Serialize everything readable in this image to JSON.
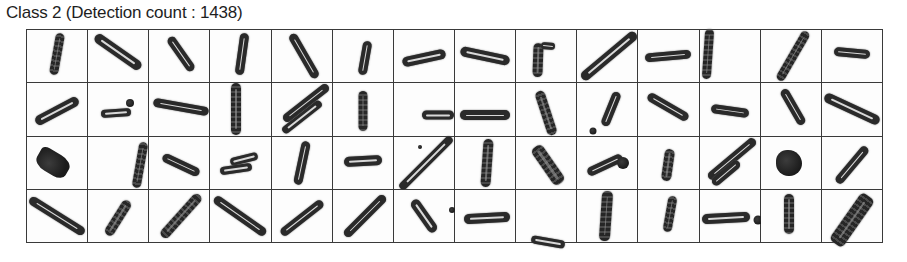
{
  "header": {
    "title": "Class 2 (Detection count : 1438)"
  },
  "grid": {
    "columns": 14,
    "rows": 4,
    "cells": [
      {
        "shapes": [
          {
            "type": "rod",
            "dx": 0,
            "dy": -2,
            "angle": -80,
            "len": 42,
            "w": 9,
            "textured": true
          }
        ]
      },
      {
        "shapes": [
          {
            "type": "rod",
            "dx": 0,
            "dy": -4,
            "angle": 35,
            "len": 55,
            "w": 10
          }
        ]
      },
      {
        "shapes": [
          {
            "type": "rod",
            "dx": 2,
            "dy": -2,
            "angle": 55,
            "len": 40,
            "w": 9
          }
        ]
      },
      {
        "shapes": [
          {
            "type": "rod",
            "dx": 2,
            "dy": -2,
            "angle": -82,
            "len": 42,
            "w": 9
          }
        ]
      },
      {
        "shapes": [
          {
            "type": "rod",
            "dx": 2,
            "dy": 0,
            "angle": 60,
            "len": 50,
            "w": 9
          }
        ]
      },
      {
        "shapes": [
          {
            "type": "rod",
            "dx": 2,
            "dy": 2,
            "angle": -80,
            "len": 34,
            "w": 9
          }
        ]
      },
      {
        "shapes": [
          {
            "type": "rod",
            "dx": 0,
            "dy": 2,
            "angle": -12,
            "len": 44,
            "w": 10
          }
        ]
      },
      {
        "shapes": [
          {
            "type": "rod",
            "dx": 0,
            "dy": 0,
            "angle": 12,
            "len": 50,
            "w": 10
          }
        ]
      },
      {
        "shapes": [
          {
            "type": "rod",
            "dx": -8,
            "dy": 4,
            "angle": -88,
            "len": 34,
            "w": 10,
            "textured": true
          },
          {
            "type": "rod",
            "dx": 2,
            "dy": -10,
            "angle": 5,
            "len": 14,
            "w": 7
          }
        ]
      },
      {
        "shapes": [
          {
            "type": "rod",
            "dx": 2,
            "dy": 0,
            "angle": -40,
            "len": 70,
            "w": 10
          }
        ]
      },
      {
        "shapes": [
          {
            "type": "rod",
            "dx": 0,
            "dy": 0,
            "angle": -5,
            "len": 46,
            "w": 9
          }
        ]
      },
      {
        "shapes": [
          {
            "type": "rod",
            "dx": -22,
            "dy": -2,
            "angle": -86,
            "len": 50,
            "w": 9,
            "textured": true
          }
        ]
      },
      {
        "shapes": [
          {
            "type": "rod",
            "dx": 2,
            "dy": 0,
            "angle": -60,
            "len": 56,
            "w": 9,
            "textured": true
          }
        ]
      },
      {
        "shapes": [
          {
            "type": "rod",
            "dx": 0,
            "dy": -3,
            "angle": 5,
            "len": 36,
            "w": 9
          }
        ]
      },
      {
        "shapes": [
          {
            "type": "rod",
            "dx": 0,
            "dy": 2,
            "angle": -28,
            "len": 48,
            "w": 10
          }
        ]
      },
      {
        "shapes": [
          {
            "type": "rod",
            "dx": -2,
            "dy": 4,
            "angle": -4,
            "len": 30,
            "w": 8
          },
          {
            "type": "blob",
            "dx": 12,
            "dy": -6,
            "size": 8,
            "r": "50%"
          }
        ]
      },
      {
        "shapes": [
          {
            "type": "rod",
            "dx": 2,
            "dy": -2,
            "angle": 10,
            "len": 56,
            "w": 9
          }
        ]
      },
      {
        "shapes": [
          {
            "type": "rod",
            "dx": -4,
            "dy": 0,
            "angle": 90,
            "len": 52,
            "w": 10,
            "textured": true
          }
        ]
      },
      {
        "shapes": [
          {
            "type": "rod",
            "dx": 4,
            "dy": -6,
            "angle": -38,
            "len": 56,
            "w": 9
          },
          {
            "type": "rod",
            "dx": 0,
            "dy": 8,
            "angle": -38,
            "len": 48,
            "w": 8
          }
        ]
      },
      {
        "shapes": [
          {
            "type": "rod",
            "dx": 0,
            "dy": 2,
            "angle": 90,
            "len": 40,
            "w": 9,
            "textured": true
          }
        ]
      },
      {
        "shapes": [
          {
            "type": "rod",
            "dx": 14,
            "dy": 6,
            "angle": 0,
            "len": 32,
            "w": 9
          }
        ]
      },
      {
        "shapes": [
          {
            "type": "rod",
            "dx": 0,
            "dy": 6,
            "angle": 0,
            "len": 50,
            "w": 10
          }
        ]
      },
      {
        "shapes": [
          {
            "type": "rod",
            "dx": 0,
            "dy": 4,
            "angle": 72,
            "len": 46,
            "w": 10,
            "textured": true
          }
        ]
      },
      {
        "shapes": [
          {
            "type": "rod",
            "dx": 4,
            "dy": 0,
            "angle": -68,
            "len": 36,
            "w": 9
          },
          {
            "type": "blob",
            "dx": -14,
            "dy": 22,
            "size": 7,
            "r": "50%"
          }
        ]
      },
      {
        "shapes": [
          {
            "type": "rod",
            "dx": 0,
            "dy": -2,
            "angle": 30,
            "len": 46,
            "w": 9
          }
        ]
      },
      {
        "shapes": [
          {
            "type": "rod",
            "dx": 0,
            "dy": 2,
            "angle": 8,
            "len": 38,
            "w": 9
          }
        ]
      },
      {
        "shapes": [
          {
            "type": "rod",
            "dx": 2,
            "dy": -2,
            "angle": 60,
            "len": 40,
            "w": 9
          }
        ]
      },
      {
        "shapes": [
          {
            "type": "rod",
            "dx": 0,
            "dy": 0,
            "angle": 25,
            "len": 60,
            "w": 10
          }
        ]
      },
      {
        "shapes": [
          {
            "type": "blob",
            "dx": -4,
            "dy": 0,
            "size": 34,
            "w": 22,
            "angle": -60,
            "r": "40% 20% 40% 30%"
          }
        ]
      },
      {
        "shapes": [
          {
            "type": "rod",
            "dx": 22,
            "dy": 2,
            "angle": -80,
            "len": 46,
            "w": 9,
            "textured": true
          }
        ]
      },
      {
        "shapes": [
          {
            "type": "rod",
            "dx": 2,
            "dy": 2,
            "angle": 25,
            "len": 40,
            "w": 9
          }
        ]
      },
      {
        "shapes": [
          {
            "type": "rod",
            "dx": 4,
            "dy": -4,
            "angle": -14,
            "len": 28,
            "w": 8
          },
          {
            "type": "rod",
            "dx": -4,
            "dy": 6,
            "angle": -8,
            "len": 32,
            "w": 8
          }
        ]
      },
      {
        "shapes": [
          {
            "type": "rod",
            "dx": 0,
            "dy": 0,
            "angle": -78,
            "len": 44,
            "w": 9
          }
        ]
      },
      {
        "shapes": [
          {
            "type": "rod",
            "dx": 0,
            "dy": -2,
            "angle": -3,
            "len": 38,
            "w": 10
          }
        ]
      },
      {
        "shapes": [
          {
            "type": "rod",
            "dx": 2,
            "dy": 0,
            "angle": -45,
            "len": 72,
            "w": 8
          },
          {
            "type": "blob",
            "dx": -4,
            "dy": -16,
            "size": 4,
            "r": "50%"
          }
        ]
      },
      {
        "shapes": [
          {
            "type": "rod",
            "dx": 2,
            "dy": 0,
            "angle": -86,
            "len": 48,
            "w": 10,
            "textured": true
          }
        ]
      },
      {
        "shapes": [
          {
            "type": "rod",
            "dx": 2,
            "dy": 2,
            "angle": 55,
            "len": 44,
            "w": 13,
            "textured": true
          }
        ]
      },
      {
        "shapes": [
          {
            "type": "rod",
            "dx": -2,
            "dy": 2,
            "angle": -25,
            "len": 38,
            "w": 9
          },
          {
            "type": "blob",
            "dx": 16,
            "dy": 0,
            "size": 12,
            "r": "50%"
          }
        ]
      },
      {
        "shapes": [
          {
            "type": "rod",
            "dx": 0,
            "dy": 2,
            "angle": -82,
            "len": 32,
            "w": 10,
            "textured": true
          }
        ]
      },
      {
        "shapes": [
          {
            "type": "rod",
            "dx": 2,
            "dy": -4,
            "angle": -40,
            "len": 60,
            "w": 9
          },
          {
            "type": "rod",
            "dx": -4,
            "dy": 10,
            "angle": -40,
            "len": 34,
            "w": 9
          }
        ]
      },
      {
        "shapes": [
          {
            "type": "blob",
            "dx": -2,
            "dy": 0,
            "size": 26,
            "r": "45% 55% 50% 50%"
          }
        ]
      },
      {
        "shapes": [
          {
            "type": "rod",
            "dx": 0,
            "dy": 2,
            "angle": -50,
            "len": 46,
            "w": 9
          }
        ]
      },
      {
        "shapes": [
          {
            "type": "rod",
            "dx": 0,
            "dy": 0,
            "angle": 32,
            "len": 64,
            "w": 9
          }
        ]
      },
      {
        "shapes": [
          {
            "type": "rod",
            "dx": 0,
            "dy": 2,
            "angle": -58,
            "len": 40,
            "w": 10,
            "textured": true
          }
        ]
      },
      {
        "shapes": [
          {
            "type": "rod",
            "dx": 2,
            "dy": 0,
            "angle": -48,
            "len": 56,
            "w": 10,
            "textured": true
          }
        ]
      },
      {
        "shapes": [
          {
            "type": "rod",
            "dx": 0,
            "dy": 0,
            "angle": 35,
            "len": 62,
            "w": 9
          }
        ]
      },
      {
        "shapes": [
          {
            "type": "rod",
            "dx": 0,
            "dy": 2,
            "angle": -38,
            "len": 52,
            "w": 9
          }
        ]
      },
      {
        "shapes": [
          {
            "type": "rod",
            "dx": 2,
            "dy": 0,
            "angle": -45,
            "len": 56,
            "w": 9
          }
        ]
      },
      {
        "shapes": [
          {
            "type": "rod",
            "dx": 0,
            "dy": 0,
            "angle": 55,
            "len": 38,
            "w": 10
          },
          {
            "type": "blob",
            "dx": 28,
            "dy": -6,
            "size": 6,
            "r": "50%"
          }
        ]
      },
      {
        "shapes": [
          {
            "type": "rod",
            "dx": 2,
            "dy": 2,
            "angle": -3,
            "len": 46,
            "w": 10
          }
        ]
      },
      {
        "shapes": [
          {
            "type": "rod",
            "dx": 2,
            "dy": 26,
            "angle": 10,
            "len": 34,
            "w": 8
          }
        ]
      },
      {
        "shapes": [
          {
            "type": "rod",
            "dx": -1,
            "dy": 0,
            "angle": -86,
            "len": 50,
            "w": 11,
            "textured": true
          }
        ]
      },
      {
        "shapes": [
          {
            "type": "rod",
            "dx": 2,
            "dy": -2,
            "angle": -80,
            "len": 36,
            "w": 9,
            "textured": true
          }
        ]
      },
      {
        "shapes": [
          {
            "type": "rod",
            "dx": -4,
            "dy": 2,
            "angle": -3,
            "len": 48,
            "w": 10
          },
          {
            "type": "blob",
            "dx": 28,
            "dy": 4,
            "size": 9,
            "r": "50%"
          }
        ]
      },
      {
        "shapes": [
          {
            "type": "rod",
            "dx": -2,
            "dy": -2,
            "angle": 90,
            "len": 40,
            "w": 10,
            "textured": true
          }
        ]
      },
      {
        "shapes": [
          {
            "type": "rod",
            "dx": 0,
            "dy": 4,
            "angle": -55,
            "len": 58,
            "w": 16,
            "textured": true
          }
        ]
      }
    ]
  }
}
